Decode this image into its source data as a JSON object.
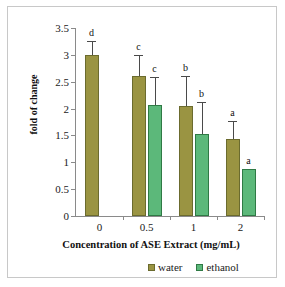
{
  "chart_data": {
    "type": "bar",
    "title": "",
    "xlabel": "Concentration of ASE Extract (mg/mL)",
    "ylabel": "fold of change",
    "categories": [
      "0",
      "0.5",
      "1",
      "2"
    ],
    "ylim": [
      0,
      3.5
    ],
    "yticks": [
      "0",
      "0.5",
      "1",
      "1.5",
      "2",
      "2.5",
      "3",
      "3.5"
    ],
    "ytick_values": [
      0,
      0.5,
      1,
      1.5,
      2,
      2.5,
      3,
      3.5
    ],
    "grid": false,
    "legend_position": "bottom-right",
    "error_bars": "upper only (SD)",
    "series": [
      {
        "name": "water",
        "color": "#9a9442",
        "values": [
          3.0,
          2.6,
          2.04,
          1.44
        ],
        "errors": [
          0.25,
          0.4,
          0.57,
          0.33
        ],
        "labels": [
          "d",
          "c",
          "b",
          "a"
        ]
      },
      {
        "name": "ethanol",
        "color": "#5cb87a",
        "values": [
          null,
          2.06,
          1.53,
          0.88
        ],
        "errors": [
          null,
          0.53,
          0.6,
          0.0
        ],
        "labels": [
          null,
          "c",
          "b",
          "a"
        ]
      }
    ],
    "annotations": {
      "description": "Letters a-d above bars denote statistically distinct groups"
    }
  },
  "legend": {
    "items": [
      {
        "label": "water",
        "color": "#9a9442"
      },
      {
        "label": "ethanol",
        "color": "#5cb87a"
      }
    ]
  }
}
